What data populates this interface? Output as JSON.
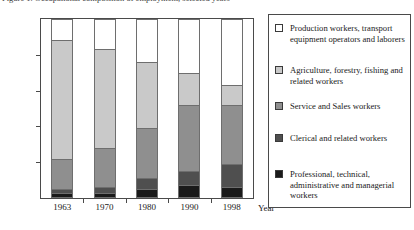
{
  "caption": {
    "text": "Figure 1. Occupational composition of employment, selected years"
  },
  "axes": {
    "y_ticks": [
      "0%",
      "20%",
      "40%",
      "60%",
      "80%",
      "100%"
    ],
    "y_tick_values": [
      0,
      20,
      40,
      60,
      80,
      100
    ],
    "x_title": "Year"
  },
  "legend": {
    "items": [
      {
        "label": "Production workers, transport equipment operators and laborers",
        "color": "#ffffff",
        "name": "legend-item-production"
      },
      {
        "label": "Agriculture, forestry, fishing and related workers",
        "color": "#c9c9c9",
        "name": "legend-item-agriculture"
      },
      {
        "label": "Service and Sales workers",
        "color": "#8f8f8f",
        "name": "legend-item-service-sales"
      },
      {
        "label": "Clerical and related workers",
        "color": "#4f4f4f",
        "name": "legend-item-clerical"
      },
      {
        "label": "Professional, technical, administrative and managerial workers",
        "color": "#1a1a1a",
        "name": "legend-item-professional"
      }
    ]
  },
  "chart_data": {
    "type": "bar",
    "subtype": "stacked-100-percent",
    "title": "",
    "xlabel": "Year",
    "ylabel": "",
    "ylim": [
      0,
      100
    ],
    "y_tick_step": 20,
    "grid": false,
    "legend_position": "right",
    "categories": [
      "1963",
      "1970",
      "1980",
      "1990",
      "1998"
    ],
    "series": [
      {
        "name": "Professional, technical, administrative and managerial workers",
        "color": "#1a1a1a",
        "values": [
          3,
          3,
          5,
          7,
          6
        ]
      },
      {
        "name": "Clerical and related workers",
        "color": "#4f4f4f",
        "values": [
          2,
          3,
          6,
          8,
          13
        ]
      },
      {
        "name": "Service and Sales workers",
        "color": "#8f8f8f",
        "values": [
          17,
          22,
          28,
          37,
          33
        ]
      },
      {
        "name": "Agriculture, forestry, fishing and related workers",
        "color": "#c9c9c9",
        "values": [
          66,
          55,
          37,
          18,
          11
        ]
      },
      {
        "name": "Production workers, transport equipment operators and laborers",
        "color": "#ffffff",
        "values": [
          12,
          17,
          24,
          30,
          37
        ]
      }
    ],
    "cumulative_tops": {
      "1963": [
        3,
        5,
        22,
        88,
        100
      ],
      "1970": [
        3,
        6,
        28,
        83,
        100
      ],
      "1980": [
        5,
        11,
        39,
        76,
        100
      ],
      "1990": [
        7,
        15,
        52,
        70,
        100
      ],
      "1998": [
        6,
        19,
        52,
        63,
        100
      ]
    }
  }
}
